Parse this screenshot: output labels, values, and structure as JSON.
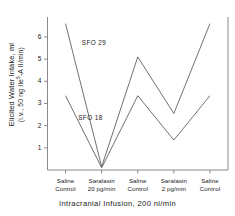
{
  "chart_data": {
    "type": "line",
    "title": "",
    "xlabel": "Intracranial Infusion, 200 nl/min",
    "ylabel_line1": "Elicited Water Intake, ml",
    "ylabel_line2_pre": "(i.v., 50 ng Ile",
    "ylabel_line2_sup": "5",
    "ylabel_line2_post": "-A II/min)",
    "categories": [
      {
        "line1": "Saline",
        "line2": "Control"
      },
      {
        "line1": "Saralasin",
        "line2": "20 pg/min"
      },
      {
        "line1": "Saline",
        "line2": "Control"
      },
      {
        "line1": "Saralasin",
        "line2": "2 pg/min"
      },
      {
        "line1": "Saline",
        "line2": "Control"
      }
    ],
    "yticks": [
      1,
      2,
      3,
      4,
      5,
      6
    ],
    "ytick_labels": [
      "1",
      "2",
      "3",
      "4",
      "5",
      "6"
    ],
    "ylim": [
      0,
      6.9
    ],
    "grid": false,
    "legend_position": "inline-annotations",
    "series": [
      {
        "name": "SFO 29",
        "label": "SFO 29",
        "values": [
          6.6,
          0.15,
          5.1,
          2.55,
          6.6
        ]
      },
      {
        "name": "SFO 18",
        "label": "SFO 18",
        "values": [
          3.35,
          0.1,
          3.35,
          1.35,
          3.35
        ]
      }
    ],
    "annotations": [
      {
        "text": "SFO 29",
        "x_frac": 0.19,
        "y_value": 5.75
      },
      {
        "text": "SFO 18",
        "x_frac": 0.17,
        "y_value": 2.35
      }
    ],
    "colors": {
      "line": "#4d4d4d",
      "axis": "#808080",
      "text": "#1a1a1a",
      "background": "#ffffff"
    }
  }
}
